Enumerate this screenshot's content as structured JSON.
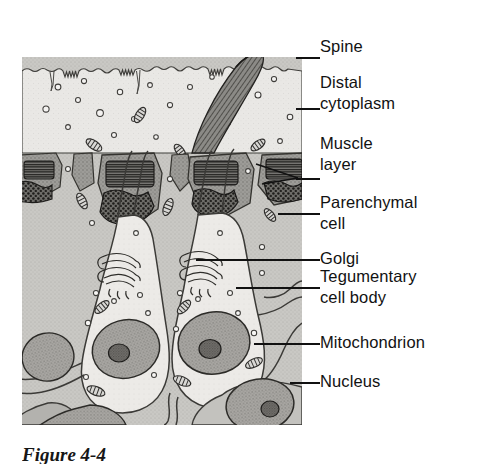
{
  "figure": {
    "caption": "Figure 4-4",
    "panel_background": "#d6d5d2",
    "ink_color": "#111111"
  },
  "labels": [
    {
      "id": "spine",
      "text": "Spine",
      "text2": "",
      "x": 320,
      "y": 47,
      "leader_x": 296,
      "leader_w": 24,
      "leader_y": 57
    },
    {
      "id": "distal-cytoplasm",
      "text": "Distal",
      "text2": "cytoplasm",
      "x": 320,
      "y": 83,
      "leader_x": 296,
      "leader_w": 24,
      "leader_y": 108
    },
    {
      "id": "muscle-layer",
      "text": "Muscle",
      "text2": "layer",
      "x": 320,
      "y": 144,
      "leader_x": 296,
      "leader_w": 24,
      "leader_y": 178
    },
    {
      "id": "parenchymal-cell",
      "text": "Parenchymal",
      "text2": "cell",
      "x": 320,
      "y": 203,
      "leader_x": 296,
      "leader_w": 24,
      "leader_y": 213
    },
    {
      "id": "golgi",
      "text": "Golgi",
      "text2": "",
      "x": 320,
      "y": 249,
      "leader_x": 296,
      "leader_w": 24,
      "leader_y": 259
    },
    {
      "id": "tegumentary-cell",
      "text": "Tegumentary",
      "text2": "cell body",
      "x": 320,
      "y": 277,
      "leader_x": 296,
      "leader_w": 24,
      "leader_y": 287
    },
    {
      "id": "mitochondrion",
      "text": "Mitochondrion",
      "text2": "",
      "x": 320,
      "y": 333,
      "leader_x": 296,
      "leader_w": 24,
      "leader_y": 343
    },
    {
      "id": "nucleus",
      "text": "Nucleus",
      "text2": "",
      "x": 320,
      "y": 372,
      "leader_x": 296,
      "leader_w": 24,
      "leader_y": 382
    }
  ],
  "structures": {
    "distal_cytoplasm": "apical syncytial layer with wavy surface, vesicles and mitochondria",
    "spine": "dark cross-hatched curved spine projecting through distal cytoplasm",
    "muscle_layer": "band of dark striated longitudinal muscle and stippled circular muscle",
    "parenchymal_cell": "stippled grey ground substance filling interstitial space",
    "golgi": "stacked curved cisternae adjacent to each tegumentary cell body",
    "tegumentary_cell_body": "two nucleated cell bodies linked to surface by cytoplasmic bridges",
    "mitochondrion": "small oval organelles with internal cristae",
    "nucleus": "large stippled oval nuclei each with a dense nucleolus"
  }
}
